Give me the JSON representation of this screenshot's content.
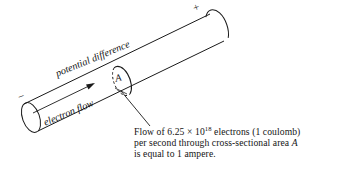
{
  "figure": {
    "background_color": "#ffffff",
    "line_color": "#1a1a1a"
  },
  "conductor": {
    "positive_terminal_sign": "+",
    "negative_terminal_sign": "−",
    "axis_label": "potential difference",
    "flow_label": "electron flow",
    "cross_section_label": "A"
  },
  "caption": {
    "line1_prefix": "Flow of 6.25 ",
    "line1_times": "×",
    "line1_base": " 10",
    "line1_exponent": "18",
    "line1_suffix": " electrons (1 coulomb)",
    "line2_prefix": "per second through cross-sectional area ",
    "line2_area": "A",
    "line3": "is equal to 1 ampere."
  }
}
